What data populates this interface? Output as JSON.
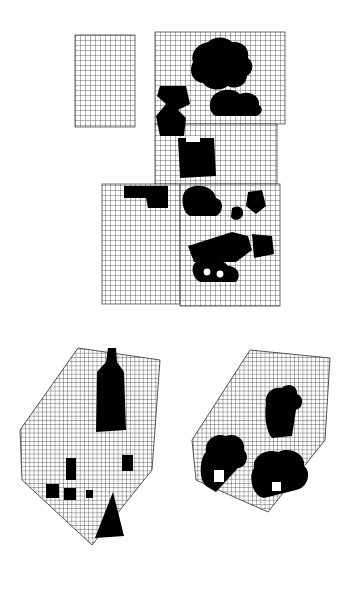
{
  "canvas": {
    "width": 361,
    "height": 594,
    "background": "#ffffff",
    "ink": "#000000",
    "grid_color": "#2b2b2b",
    "grid_spacing_px": 5,
    "description": "Abstract black-and-white figure: grid-filled polygons overlaid with solid black silhouette blobs"
  },
  "groups": [
    {
      "id": "top-assembly",
      "label": "top-assembly",
      "bounds": {
        "x": 75,
        "y": 30,
        "width": 212,
        "height": 280
      }
    },
    {
      "id": "lower-left-hexagon",
      "label": "lower-left-hexagon",
      "bounds": {
        "x": 10,
        "y": 330,
        "width": 160,
        "height": 220
      }
    },
    {
      "id": "lower-right-hexagon",
      "label": "lower-right-hexagon",
      "bounds": {
        "x": 185,
        "y": 330,
        "width": 155,
        "height": 190
      }
    }
  ],
  "grid_tiles": [
    {
      "id": "tile-top-left",
      "x": 75,
      "y": 35,
      "width": 60,
      "height": 92
    },
    {
      "id": "tile-top-right",
      "x": 155,
      "y": 32,
      "width": 130,
      "height": 92
    },
    {
      "id": "tile-mid",
      "x": 155,
      "y": 124,
      "width": 122,
      "height": 60
    },
    {
      "id": "tile-lower-left",
      "x": 102,
      "y": 184,
      "width": 78,
      "height": 120
    },
    {
      "id": "tile-lower-right",
      "x": 180,
      "y": 184,
      "width": 100,
      "height": 122
    }
  ],
  "hexagons": [
    {
      "id": "hex-left",
      "points": "20,430 78,348 160,360 152,470 92,545 22,480"
    },
    {
      "id": "hex-right",
      "points": "192,440 250,350 330,358 325,440 268,512 196,480"
    }
  ],
  "blobs": [
    {
      "id": "blob-top-cloud",
      "group": "top-assembly"
    },
    {
      "id": "blob-top-right-lobe",
      "group": "top-assembly"
    },
    {
      "id": "blob-mid-left-bar",
      "group": "top-assembly"
    },
    {
      "id": "blob-mid-right-wedge",
      "group": "top-assembly"
    },
    {
      "id": "blob-center-block",
      "group": "top-assembly"
    },
    {
      "id": "blob-left-step",
      "group": "top-assembly"
    },
    {
      "id": "blob-right-hook",
      "group": "top-assembly"
    },
    {
      "id": "blob-small-dot",
      "group": "top-assembly"
    },
    {
      "id": "blob-diagonal-bar",
      "group": "top-assembly"
    },
    {
      "id": "blob-bottom-lump",
      "group": "top-assembly"
    },
    {
      "id": "blob-bottle",
      "group": "lower-left-hexagon"
    },
    {
      "id": "blob-cone",
      "group": "lower-left-hexagon"
    },
    {
      "id": "blob-small-box-a",
      "group": "lower-left-hexagon"
    },
    {
      "id": "blob-small-box-b",
      "group": "lower-left-hexagon"
    },
    {
      "id": "blob-small-box-c",
      "group": "lower-left-hexagon"
    },
    {
      "id": "blob-person",
      "group": "lower-right-hexagon"
    },
    {
      "id": "blob-cluster-left",
      "group": "lower-right-hexagon"
    },
    {
      "id": "blob-cluster-right",
      "group": "lower-right-hexagon"
    }
  ]
}
